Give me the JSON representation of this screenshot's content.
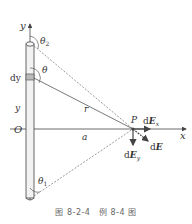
{
  "figure": {
    "caption": "图 8-2-4　例 8-4 图",
    "labels": {
      "y_axis": "y",
      "x_axis": "x",
      "origin": "O",
      "theta2": "θ",
      "theta2_sub": "2",
      "theta1": "θ",
      "theta1_sub": "1",
      "theta": "θ",
      "dy": "dy",
      "y": "y",
      "r": "r",
      "a": "a",
      "P": "P",
      "dEx_d": "d",
      "dEx_E": "E",
      "dEx_sub": "x",
      "dEy_d": "d",
      "dEy_E": "E",
      "dEy_sub": "y",
      "dE_d": "d",
      "dE_E": "E"
    },
    "colors": {
      "line": "#444444",
      "rod_fill": "#eeeeee",
      "element_fill": "#bbbbbb",
      "text": "#333333"
    }
  }
}
